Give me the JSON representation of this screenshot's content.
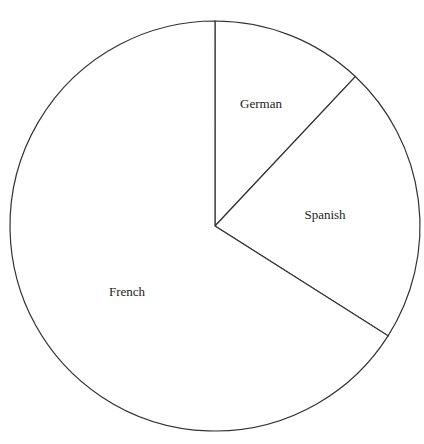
{
  "chart_data": {
    "type": "pie",
    "title": "",
    "categories": [
      "German",
      "Spanish",
      "French"
    ],
    "values": [
      12,
      22,
      66
    ],
    "start_angle_deg": 0,
    "direction": "clockwise",
    "legend": "none",
    "labels_inside": true
  },
  "labels": {
    "german": "German",
    "spanish": "Spanish",
    "french": "French"
  }
}
